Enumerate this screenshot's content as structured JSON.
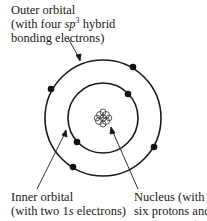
{
  "diagram": {
    "labels": {
      "outer": {
        "line1": "Outer orbital",
        "line2_pre": "(with four ",
        "line2_em": "sp",
        "line2_sup": "3",
        "line2_post": " hybrid",
        "line3": "bonding electrons)"
      },
      "inner": {
        "line1": "Inner orbital",
        "line2_pre": "(with two 1",
        "line2_em": "s",
        "line2_post": " electrons)"
      },
      "nucleus": {
        "line1": "Nucleus (with",
        "line2": "six protons and",
        "line3": "six neutrons)"
      }
    },
    "colors": {
      "ink": "#1a1a1a",
      "background": "#ffffff"
    },
    "center": [
      103,
      118
    ],
    "outer_radius": 58,
    "inner_radius": 35,
    "outer_electrons": 4,
    "inner_electrons": 2
  }
}
